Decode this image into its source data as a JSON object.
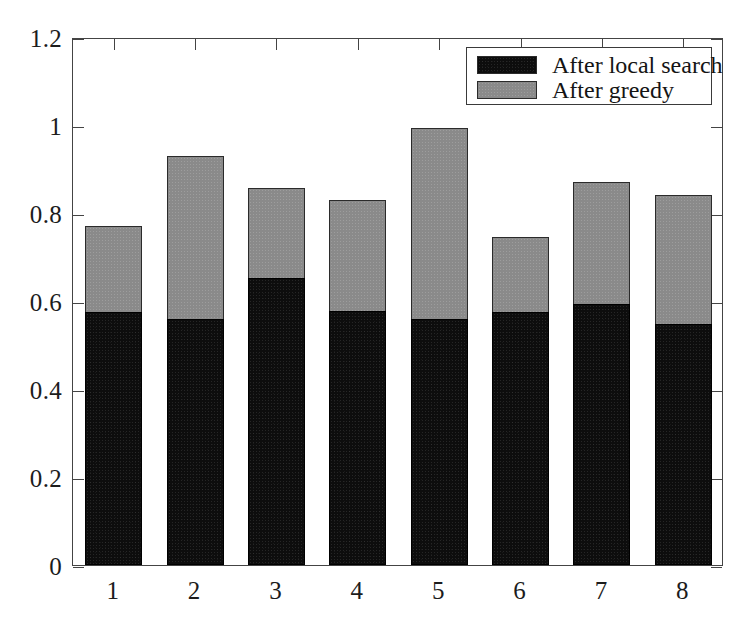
{
  "chart_data": {
    "type": "bar",
    "subtype": "stacked-vertical",
    "title": "",
    "xlabel": "",
    "ylabel": "",
    "categories": [
      "1",
      "2",
      "3",
      "4",
      "5",
      "6",
      "7",
      "8"
    ],
    "series": [
      {
        "name": "After local search",
        "color": "#0d0d0d",
        "values": [
          0.575,
          0.558,
          0.652,
          0.578,
          0.558,
          0.575,
          0.593,
          0.548
        ]
      },
      {
        "name": "After greedy",
        "color": "#8a8a8a",
        "values": [
          0.77,
          0.93,
          0.857,
          0.83,
          0.993,
          0.745,
          0.87,
          0.84
        ]
      }
    ],
    "stacking_note": "Gray 'After greedy' bar is drawn to its full value; black 'After local search' bar is overlaid from 0 up to its value.",
    "ylim": [
      0,
      1.2
    ],
    "yticks": [
      0,
      0.2,
      0.4,
      0.6,
      0.8,
      1,
      1.2
    ],
    "ytick_labels": [
      "0",
      "0.2",
      "0.4",
      "0.6",
      "0.8",
      "1",
      "1.2"
    ],
    "xticks": [
      1,
      2,
      3,
      4,
      5,
      6,
      7,
      8
    ],
    "xtick_labels": [
      "1",
      "2",
      "3",
      "4",
      "5",
      "6",
      "7",
      "8"
    ],
    "grid": false,
    "legend_position": "upper right",
    "legend_entries": [
      "After local search",
      "After greedy"
    ],
    "frame_color": "#444444",
    "background": "#ffffff"
  },
  "legend": {
    "items": [
      {
        "label": "After local search",
        "swatch": "#0d0d0d",
        "style": "local"
      },
      {
        "label": "After greedy",
        "swatch": "#8a8a8a",
        "style": "greedy"
      }
    ]
  }
}
